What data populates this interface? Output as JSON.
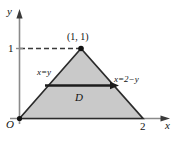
{
  "figure": {
    "type": "math-diagram",
    "colors": {
      "region_fill": "#c8c8c8",
      "outline": "#2b2b2b",
      "axis": "#8a8a8a",
      "text": "#121212",
      "dashed": "#3a3a3a"
    },
    "axes": {
      "y_axis_label": "y",
      "x_axis_label": "x",
      "origin_label": "O"
    },
    "ticks": {
      "y": [
        {
          "value": "1",
          "label": "1"
        }
      ],
      "x": [
        {
          "value": "2",
          "label": "2"
        }
      ]
    },
    "annotations": {
      "vertex_label": "(1, 1)",
      "left_edge_label": "x=y",
      "right_edge_label": "x=2−y",
      "region_label": "D"
    },
    "geometry": {
      "vertices": [
        {
          "name": "origin",
          "x": 0,
          "y": 0
        },
        {
          "name": "apex",
          "x": 1,
          "y": 1
        },
        {
          "name": "right",
          "x": 2,
          "y": 0
        }
      ],
      "horizontal_arrow": {
        "y": 0.47,
        "from_x": 0.47,
        "to_x": 1.53
      }
    }
  }
}
